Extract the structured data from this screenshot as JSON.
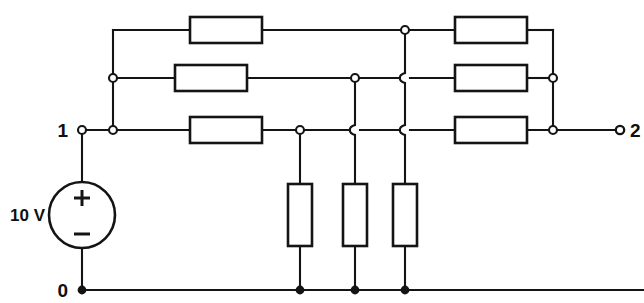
{
  "diagram": {
    "kind": "electrical-circuit-schematic",
    "background_color": "#ffffff",
    "line_color": "#141414",
    "labels": {
      "terminal_top": "1",
      "terminal_right": "2",
      "terminal_bottom": "0",
      "source_value": "10 V",
      "source_plus": "+",
      "source_minus": "–"
    },
    "source": {
      "name": "voltage-source",
      "value": "10 V",
      "cx": 75,
      "cy": 215,
      "r": 33,
      "polarity_top": "+",
      "polarity_bottom": "–"
    },
    "rows": {
      "top_y": 30,
      "middle_y": 78,
      "bottom_y": 130,
      "ground_y": 290
    },
    "buses": {
      "left_x": 113,
      "mid_left_x": 300,
      "mid_center_x": 355,
      "mid_right_x": 405,
      "right_x": 553,
      "terminal_left_x": 82,
      "terminal_right_x": 620
    },
    "resistors": [
      {
        "id": "R-top-left",
        "orientation": "horizontal",
        "x": 190,
        "y": 30,
        "w": 72,
        "h": 26
      },
      {
        "id": "R-top-right",
        "orientation": "horizontal",
        "x": 455,
        "y": 30,
        "w": 72,
        "h": 26
      },
      {
        "id": "R-mid-left",
        "orientation": "horizontal",
        "x": 175,
        "y": 78,
        "w": 72,
        "h": 26
      },
      {
        "id": "R-mid-right",
        "orientation": "horizontal",
        "x": 455,
        "y": 78,
        "w": 72,
        "h": 26
      },
      {
        "id": "R-bot-left",
        "orientation": "horizontal",
        "x": 190,
        "y": 130,
        "w": 72,
        "h": 26
      },
      {
        "id": "R-bot-right",
        "orientation": "horizontal",
        "x": 455,
        "y": 130,
        "w": 72,
        "h": 26
      },
      {
        "id": "R-vert-left",
        "orientation": "vertical",
        "x": 300,
        "y": 215,
        "w": 24,
        "h": 62
      },
      {
        "id": "R-vert-center",
        "orientation": "vertical",
        "x": 355,
        "y": 215,
        "w": 24,
        "h": 62
      },
      {
        "id": "R-vert-right",
        "orientation": "vertical",
        "x": 405,
        "y": 215,
        "w": 24,
        "h": 62
      }
    ],
    "nodes": [
      {
        "id": "node-term-1",
        "x": 82,
        "y": 130,
        "style": "open"
      },
      {
        "id": "node-left-bus-bot",
        "x": 113,
        "y": 130,
        "style": "open"
      },
      {
        "id": "node-left-bus-mid",
        "x": 113,
        "y": 78,
        "style": "open"
      },
      {
        "id": "node-midleft-bot",
        "x": 300,
        "y": 130,
        "style": "open"
      },
      {
        "id": "node-midcenter-mid",
        "x": 355,
        "y": 78,
        "style": "open"
      },
      {
        "id": "node-midright-top",
        "x": 405,
        "y": 30,
        "style": "open"
      },
      {
        "id": "node-right-bus-mid",
        "x": 553,
        "y": 78,
        "style": "open"
      },
      {
        "id": "node-right-bus-bot",
        "x": 553,
        "y": 130,
        "style": "open"
      },
      {
        "id": "node-term-2",
        "x": 620,
        "y": 130,
        "style": "open"
      },
      {
        "id": "node-gnd-term-0",
        "x": 82,
        "y": 290,
        "style": "solid"
      },
      {
        "id": "node-gnd-left",
        "x": 300,
        "y": 290,
        "style": "solid"
      },
      {
        "id": "node-gnd-center",
        "x": 355,
        "y": 290,
        "style": "solid"
      },
      {
        "id": "node-gnd-right",
        "x": 405,
        "y": 290,
        "style": "solid"
      }
    ],
    "hops": [
      {
        "id": "hop-midcenter-over-bottom-row",
        "x": 355,
        "y": 130
      },
      {
        "id": "hop-midright-over-middle-row",
        "x": 405,
        "y": 78
      },
      {
        "id": "hop-midright-over-bottom-row",
        "x": 405,
        "y": 130
      }
    ]
  }
}
